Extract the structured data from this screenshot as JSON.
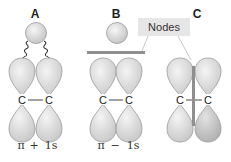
{
  "panels": [
    {
      "id": "A",
      "label": "A",
      "caption_left": "π",
      "caption_op": "+",
      "caption_right": "1s",
      "atoms": [
        "C",
        "C"
      ]
    },
    {
      "id": "B",
      "label": "B",
      "caption_left": "π",
      "caption_op": "−",
      "caption_right": "1s",
      "atoms": [
        "C",
        "C"
      ]
    },
    {
      "id": "C",
      "label": "C",
      "atoms": [
        "C",
        "C"
      ]
    }
  ],
  "callout": {
    "label": "Nodes"
  },
  "colors": {
    "lobe_fill": "#d6d6d6",
    "lobe_light": "#ececec",
    "lobe_dark": "#c4c4c4",
    "lobe_stroke": "#9a9a9a",
    "node_bar": "#8f8f8f",
    "callout_bg": "#e6e6e6",
    "wavy": "#222222"
  }
}
